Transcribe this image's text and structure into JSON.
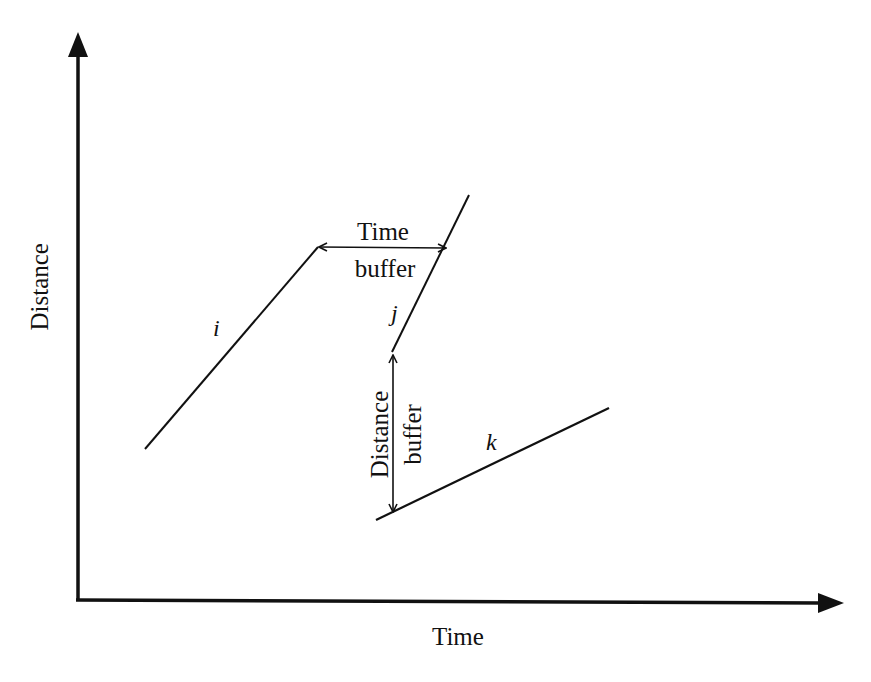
{
  "diagram": {
    "axes": {
      "x_label": "Time",
      "y_label": "Distance"
    },
    "trajectories": [
      {
        "id": "i",
        "label": "i",
        "from": [
          145,
          449
        ],
        "to": [
          318,
          247
        ]
      },
      {
        "id": "j",
        "label": "j",
        "from": [
          392,
          352
        ],
        "to": [
          469,
          195
        ]
      },
      {
        "id": "k",
        "label": "k",
        "from": [
          376,
          520
        ],
        "to": [
          609,
          408
        ]
      }
    ],
    "annotations": {
      "time_buffer": {
        "line1": "Time",
        "line2": "buffer",
        "from": [
          318,
          247
        ],
        "to": [
          446,
          247
        ]
      },
      "distance_buffer": {
        "line1": "Distance",
        "line2": "buffer",
        "from": [
          393,
          354
        ],
        "to": [
          393,
          513
        ]
      }
    },
    "colors": {
      "ink": "#111111",
      "background": "#ffffff"
    }
  }
}
